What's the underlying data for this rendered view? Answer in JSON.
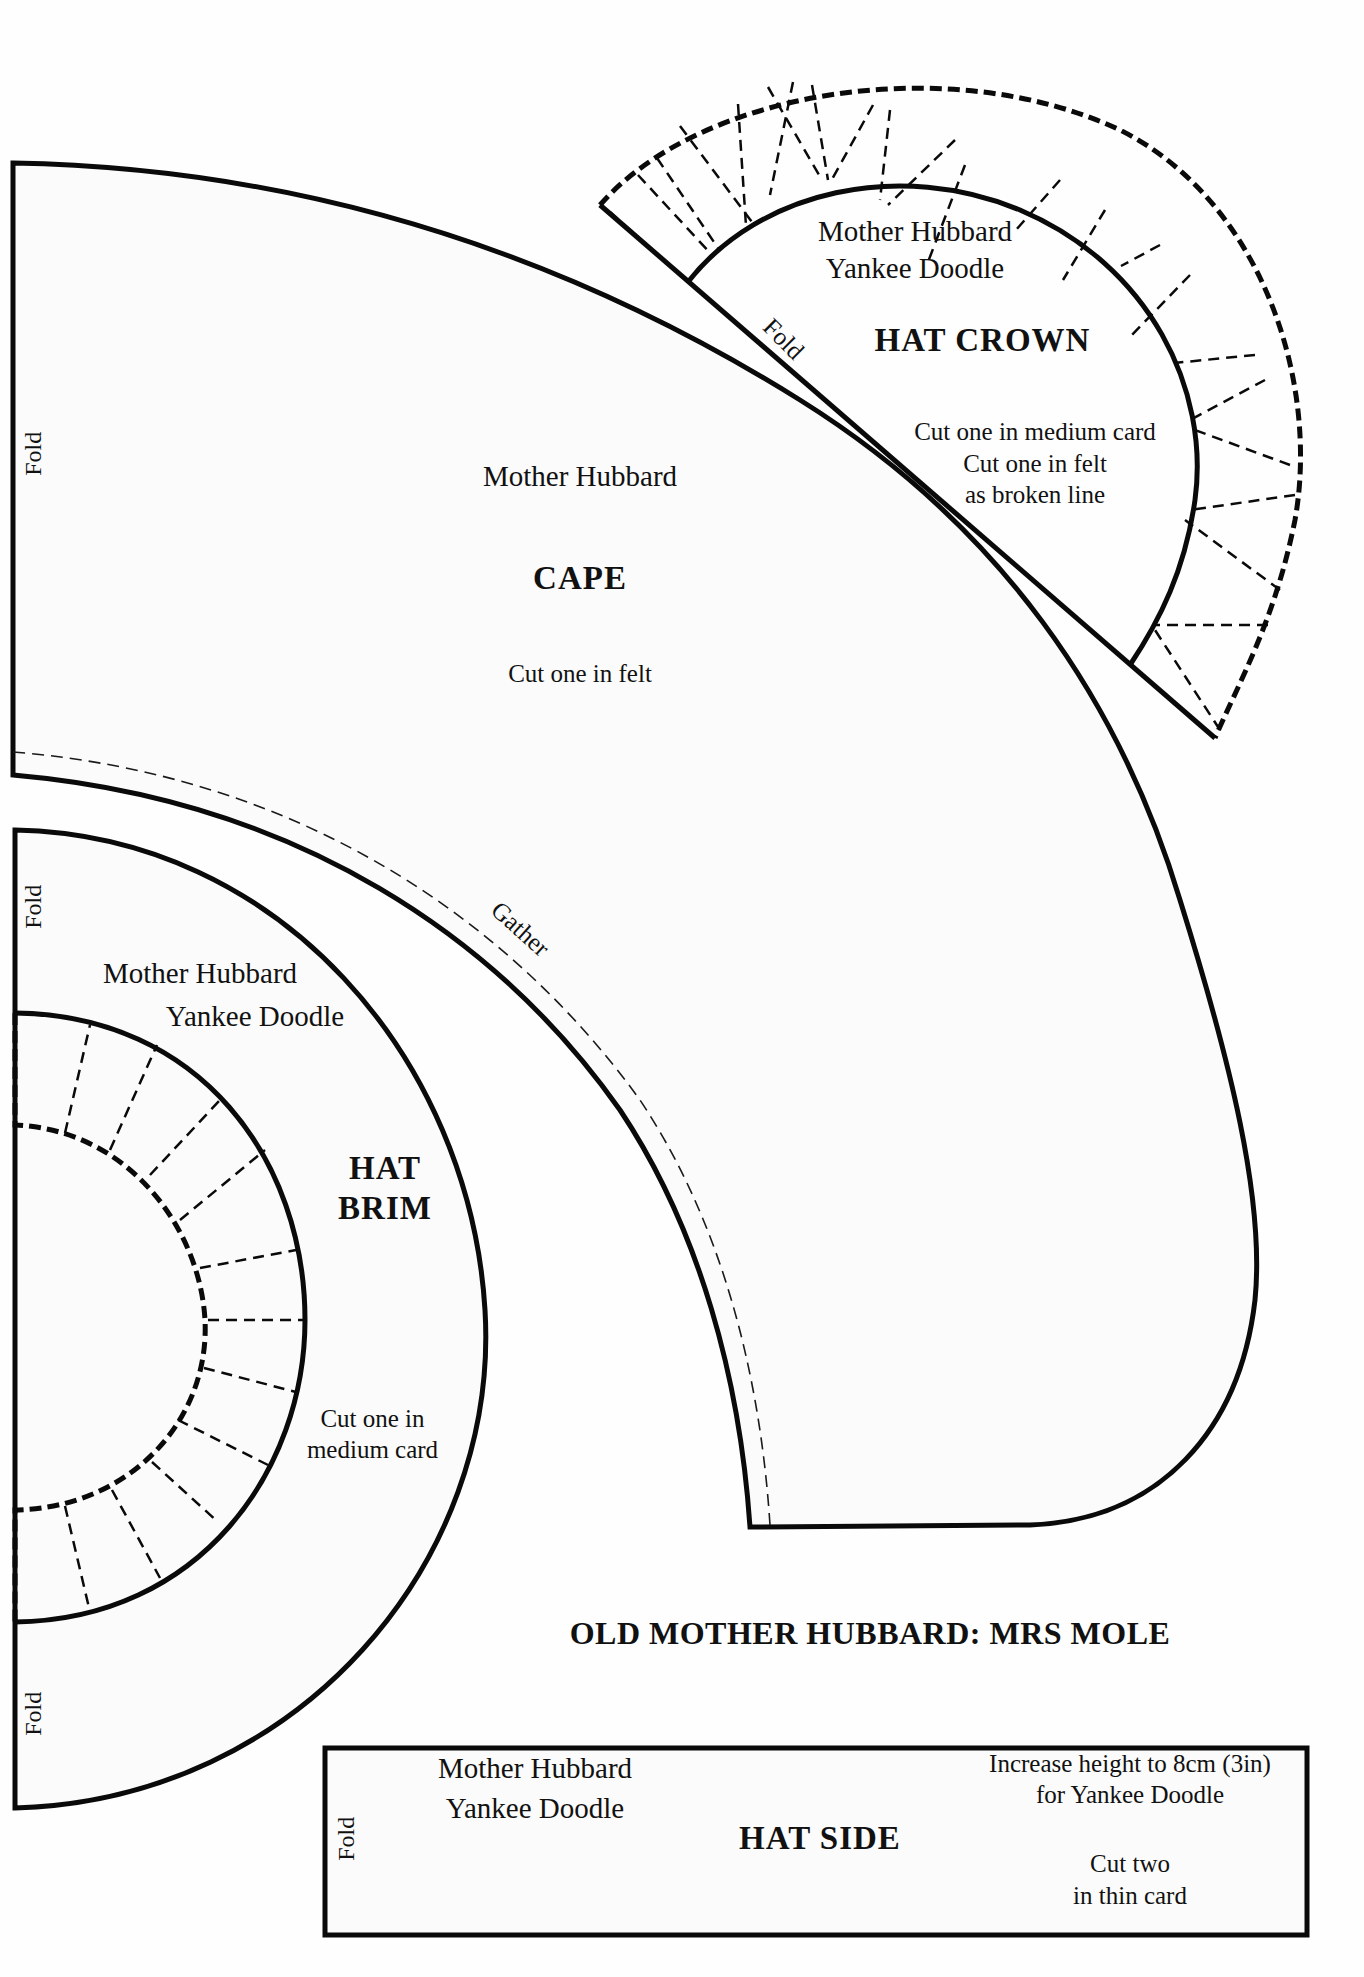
{
  "page": {
    "title": "OLD MOTHER HUBBARD: MRS MOLE"
  },
  "pieces": {
    "cape": {
      "character": "Mother Hubbard",
      "name": "CAPE",
      "instructions": "Cut one in felt",
      "fold_label": "Fold",
      "gather_label": "Gather"
    },
    "hat_crown": {
      "character_line1": "Mother Hubbard",
      "character_line2": "Yankee Doodle",
      "name": "HAT CROWN",
      "instructions_line1": "Cut one in medium card",
      "instructions_line2": "Cut one in felt",
      "instructions_line3": "as broken line",
      "fold_label": "Fold"
    },
    "hat_brim": {
      "character_line1": "Mother Hubbard",
      "character_line2": "Yankee Doodle",
      "name_line1": "HAT",
      "name_line2": "BRIM",
      "instructions_line1": "Cut one in",
      "instructions_line2": "medium card",
      "fold_label_top": "Fold",
      "fold_label_bottom": "Fold"
    },
    "hat_side": {
      "character_line1": "Mother Hubbard",
      "character_line2": "Yankee Doodle",
      "name": "HAT SIDE",
      "note_line1": "Increase height to 8cm (3in)",
      "note_line2": "for Yankee Doodle",
      "instructions_line1": "Cut two",
      "instructions_line2": "in thin card",
      "fold_label": "Fold"
    }
  },
  "colors": {
    "ink": "#0a0a0a",
    "paper": "#fbfbfb"
  }
}
